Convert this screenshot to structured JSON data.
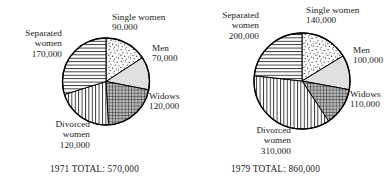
{
  "chart_data": [
    {
      "type": "pie",
      "title": "1971 TOTAL: 570,000",
      "year": "1971",
      "total": 570000,
      "total_caption": "1971 TOTAL: 570,000",
      "categories": [
        "Single women",
        "Men",
        "Widows",
        "Divorced women",
        "Separated women"
      ],
      "values": [
        90000,
        70000,
        120000,
        120000,
        170000
      ],
      "value_labels": [
        "90,000",
        "70,000",
        "120,000",
        "120,000",
        "170,000"
      ],
      "start_angle_deg": 0,
      "direction": "clockwise",
      "legend": "none",
      "grid": false,
      "slices": [
        {
          "label": "Single women",
          "value": 90000,
          "value_label": "90,000",
          "pattern": "stipple-dots",
          "start_deg": 0.0,
          "sweep_deg": 56.84
        },
        {
          "label": "Men",
          "value": 70000,
          "value_label": "70,000",
          "pattern": "light-checker",
          "start_deg": 56.84,
          "sweep_deg": 44.21
        },
        {
          "label": "Widows",
          "value": 120000,
          "value_label": "120,000",
          "pattern": "dense-grid",
          "start_deg": 101.05,
          "sweep_deg": 75.79
        },
        {
          "label": "Divorced women",
          "value": 120000,
          "value_label": "120,000",
          "pattern": "vertical-lines",
          "start_deg": 176.84,
          "sweep_deg": 75.79
        },
        {
          "label": "Separated women",
          "value": 170000,
          "value_label": "170,000",
          "pattern": "horizontal-lines",
          "start_deg": 252.63,
          "sweep_deg": 107.37
        }
      ]
    },
    {
      "type": "pie",
      "title": "1979 TOTAL: 860,000",
      "year": "1979",
      "total": 860000,
      "total_caption": "1979 TOTAL: 860,000",
      "categories": [
        "Single women",
        "Men",
        "Widows",
        "Divorced women",
        "Separated women"
      ],
      "values": [
        140000,
        100000,
        110000,
        310000,
        200000
      ],
      "value_labels": [
        "140,000",
        "100,000",
        "110,000",
        "310,000",
        "200,000"
      ],
      "start_angle_deg": 0,
      "direction": "clockwise",
      "legend": "none",
      "grid": false,
      "slices": [
        {
          "label": "Single women",
          "value": 140000,
          "value_label": "140,000",
          "pattern": "stipple-dots",
          "start_deg": 0.0,
          "sweep_deg": 58.6
        },
        {
          "label": "Men",
          "value": 100000,
          "value_label": "100,000",
          "pattern": "light-checker",
          "start_deg": 58.6,
          "sweep_deg": 41.86
        },
        {
          "label": "Widows",
          "value": 110000,
          "value_label": "110,000",
          "pattern": "dense-grid",
          "start_deg": 100.46,
          "sweep_deg": 46.05
        },
        {
          "label": "Divorced women",
          "value": 310000,
          "value_label": "310,000",
          "pattern": "vertical-lines",
          "start_deg": 146.51,
          "sweep_deg": 129.77
        },
        {
          "label": "Separated women",
          "value": 200000,
          "value_label": "200,000",
          "pattern": "horizontal-lines",
          "start_deg": 276.28,
          "sweep_deg": 83.72
        }
      ]
    }
  ],
  "chart1971": {
    "total_caption": "1971 TOTAL: 570,000",
    "labels": {
      "single": {
        "name": "Single women",
        "value": "90,000"
      },
      "men": {
        "name": "Men",
        "value": "70,000"
      },
      "widows": {
        "name": "Widows",
        "value": "120,000"
      },
      "divorced": {
        "name_line1": "Divorced",
        "name_line2": "women",
        "value": "120,000"
      },
      "separated": {
        "name_line1": "Separated",
        "name_line2": "women",
        "value": "170,000"
      }
    }
  },
  "chart1979": {
    "total_caption": "1979 TOTAL: 860,000",
    "labels": {
      "single": {
        "name": "Single women",
        "value": "140,000"
      },
      "men": {
        "name": "Men",
        "value": "100,000"
      },
      "widows": {
        "name": "Widows",
        "value": "110,000"
      },
      "divorced": {
        "name_line1": "Divorced",
        "name_line2": "women",
        "value": "310,000"
      },
      "separated": {
        "name_line1": "Separated",
        "name_line2": "women",
        "value": "200,000"
      }
    }
  },
  "colors": {
    "ink": "#1a1a1a",
    "background": "#ffffff",
    "men_fill": "#c9c9c9",
    "widows_fill": "#8f8f8f",
    "stroke": "#000000"
  }
}
